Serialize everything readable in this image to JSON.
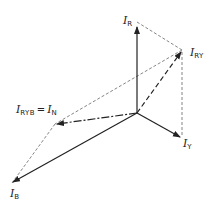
{
  "diagram": {
    "type": "phasor-diagram",
    "labels": {
      "ir": {
        "main": "I",
        "sub": "R"
      },
      "iry": {
        "main": "I",
        "sub": "RY"
      },
      "iy": {
        "main": "I",
        "sub": "Y"
      },
      "ib": {
        "main": "I",
        "sub": "B"
      },
      "iryb": {
        "main": "I",
        "sub": "RYB",
        "eq": "=",
        "main2": "I",
        "sub2": "N"
      }
    },
    "colors": {
      "line": "#333333",
      "dashed": "#555555",
      "background": "#ffffff"
    }
  }
}
